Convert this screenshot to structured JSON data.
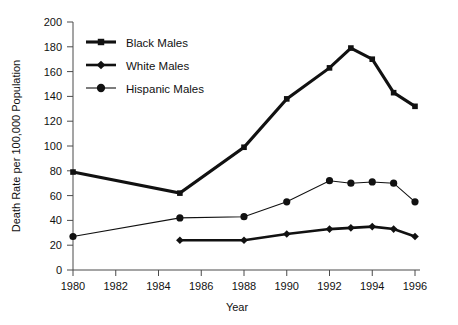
{
  "chart_data": {
    "type": "line",
    "title": "",
    "xlabel": "Year",
    "ylabel": "Death Rate per 100,000 Population",
    "xlim": [
      1980,
      1996
    ],
    "ylim": [
      0,
      200
    ],
    "ytick_step": 20,
    "grid": false,
    "legend_position": "upper-left-inside",
    "xticks": [
      1980,
      1982,
      1984,
      1986,
      1988,
      1990,
      1992,
      1994,
      1996
    ],
    "xtick_labels": [
      "1980",
      "1982",
      "1984",
      "1986",
      "1988",
      "1990",
      "1992",
      "1994",
      "1996"
    ],
    "yticks": [
      0,
      20,
      40,
      60,
      80,
      100,
      120,
      140,
      160,
      180,
      200
    ],
    "ytick_labels": [
      "0",
      "20",
      "40",
      "60",
      "80",
      "100",
      "120",
      "140",
      "160",
      "180",
      "200"
    ],
    "series": [
      {
        "name": "Black Males",
        "marker": "square",
        "line_weight": "thick",
        "color": "#111111",
        "x": [
          1980,
          1985,
          1988,
          1990,
          1992,
          1993,
          1994,
          1995,
          1996
        ],
        "values": [
          79,
          62,
          99,
          138,
          163,
          179,
          170,
          143,
          132
        ]
      },
      {
        "name": "White Males",
        "marker": "diamond",
        "line_weight": "medium",
        "color": "#111111",
        "x": [
          1985,
          1988,
          1990,
          1992,
          1993,
          1994,
          1995,
          1996
        ],
        "values": [
          24,
          24,
          29,
          33,
          34,
          35,
          33,
          27
        ]
      },
      {
        "name": "Hispanic Males",
        "marker": "circle",
        "line_weight": "thin",
        "color": "#111111",
        "x": [
          1980,
          1985,
          1988,
          1990,
          1992,
          1993,
          1994,
          1995,
          1996
        ],
        "values": [
          27,
          42,
          43,
          55,
          72,
          70,
          71,
          70,
          55
        ]
      }
    ]
  },
  "legend": {
    "entries": [
      {
        "label": "Black Males"
      },
      {
        "label": "White Males"
      },
      {
        "label": "Hispanic Males"
      }
    ]
  },
  "axes": {
    "x_title": "Year",
    "y_title": "Death Rate per 100,000 Population"
  }
}
